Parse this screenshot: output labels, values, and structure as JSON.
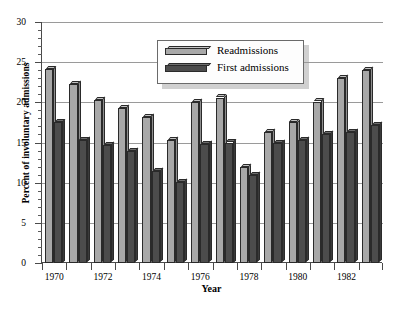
{
  "chart_data": {
    "type": "bar",
    "title": "",
    "xlabel": "Year",
    "ylabel": "Percent of involuntary admissions",
    "categories": [
      "1970",
      "1971",
      "1972",
      "1973",
      "1974",
      "1975",
      "1976",
      "1977",
      "1978",
      "1979",
      "1980",
      "1981",
      "1982",
      "1983"
    ],
    "tick_labels_shown": [
      "1970",
      "1972",
      "1974",
      "1976",
      "1978",
      "1980",
      "1982"
    ],
    "ylim": [
      0,
      30
    ],
    "yticks_major": [
      0,
      5,
      10,
      15,
      20,
      25,
      30
    ],
    "ytick_minor_step": 1,
    "grid": "horizontal-major",
    "legend_position": "top-center",
    "series": [
      {
        "name": "Readmissions",
        "color": "#a8a8a8",
        "values": [
          24.1,
          22.3,
          20.3,
          19.3,
          18.2,
          15.3,
          20.0,
          20.6,
          12.0,
          16.3,
          17.5,
          20.1,
          23.0,
          24.0
        ]
      },
      {
        "name": "First admissions",
        "color": "#4c4c4c",
        "values": [
          17.5,
          15.3,
          14.7,
          13.9,
          11.5,
          10.1,
          14.8,
          15.0,
          11.0,
          14.9,
          15.3,
          16.1,
          16.3,
          17.2
        ]
      }
    ]
  },
  "legend": {
    "entries": [
      {
        "label": "Readmissions",
        "swatch": "light-gray-bar-swatch"
      },
      {
        "label": "First admissions",
        "swatch": "dark-gray-bar-swatch"
      }
    ]
  },
  "caption": {
    "text": ""
  }
}
